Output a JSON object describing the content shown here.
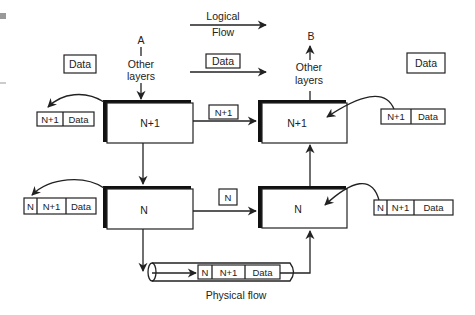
{
  "diagram": {
    "logical_flow": {
      "line1": "Logical",
      "line2": "Flow"
    },
    "physical_flow": "Physical flow",
    "endpoint_a": "A",
    "endpoint_b": "B",
    "other_layers": {
      "line1": "Other",
      "line2": "layers"
    },
    "data_label": "Data",
    "layers": {
      "top_left": "N+1",
      "top_right": "N+1",
      "bottom_left": "N",
      "bottom_right": "N"
    },
    "peer_headers": {
      "upper": "N+1",
      "lower": "N"
    },
    "pdu_upper": [
      "N+1",
      "Data"
    ],
    "pdu_lower": [
      "N",
      "N+1",
      "Data"
    ]
  },
  "colors": {
    "stroke": "#222222",
    "background": "#ffffff"
  }
}
